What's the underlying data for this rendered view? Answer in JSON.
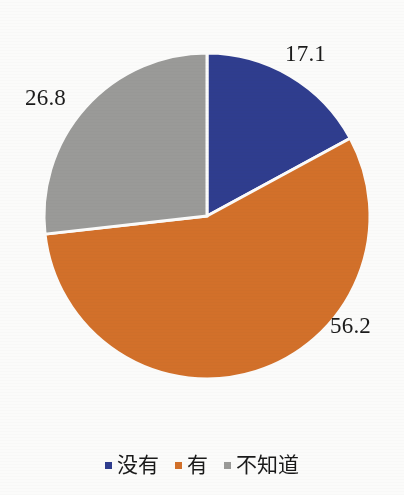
{
  "chart_data": {
    "type": "pie",
    "title": "",
    "xlabel": "",
    "ylabel": "",
    "categories": [
      "没有",
      "有",
      "不知道"
    ],
    "values": [
      17.1,
      56.2,
      26.8
    ],
    "value_labels": [
      "17.1",
      "56.2",
      "26.8"
    ],
    "colors": [
      "#2f3d8e",
      "#d2702a",
      "#9a9a98"
    ],
    "legend": {
      "position": "bottom",
      "entries": [
        {
          "label": "没有",
          "color": "#2f3d8e",
          "value": 17.1
        },
        {
          "label": "有",
          "color": "#d2702a",
          "value": 56.2
        },
        {
          "label": "不知道",
          "color": "#9a9a98",
          "value": 26.8
        }
      ]
    },
    "start_angle_deg": 0,
    "direction": "clockwise",
    "grid": false,
    "background": "#fbfbfa",
    "slice_border": "#ffffff"
  },
  "slices": [
    {
      "name": "slice-no",
      "label": "没有",
      "value_text": "17.1",
      "color": "#2f3d8e",
      "path": "M 207 216 L 207 53 A 163 163 0 0 1 350.4 292.4 Z"
    },
    {
      "name": "slice-yes",
      "label": "有",
      "value_text": "56.2",
      "color": "#d2702a",
      "path": "M 207 216 L 350.4 292.4 A 163 163 0 0 1 47.4 162.9 Z"
    },
    {
      "name": "slice-notknow",
      "label": "不知道",
      "value_text": "26.8",
      "color": "#9a9a98",
      "path": "M 207 216 L 47.4 162.9 A 163 163 0 0 1 207 53 Z"
    }
  ]
}
